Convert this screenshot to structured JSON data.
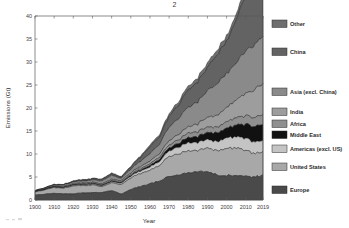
{
  "figure": {
    "title_fragment": "2",
    "background_color": "#ffffff"
  },
  "axes": {
    "x_title": "Year",
    "y_title": "Emissions (Gt)",
    "x_ticks": [
      "1900",
      "1910",
      "1920",
      "1930",
      "1940",
      "1950",
      "1960",
      "1970",
      "1980",
      "1990",
      "2000",
      "2010",
      "2019"
    ],
    "y_ticks": [
      "0",
      "5",
      "10",
      "15",
      "20",
      "25",
      "30",
      "35",
      "40"
    ],
    "x_min": 1900,
    "x_max": 2019,
    "y_min": 0,
    "y_max": 40
  },
  "legend": {
    "items": [
      {
        "label": "Other",
        "color": "#6e6e6e"
      },
      {
        "label": "China",
        "color": "#636363"
      },
      {
        "label": "Asia (excl. China)",
        "color": "#8a8a8a"
      },
      {
        "label": "India",
        "color": "#9d9d9d"
      },
      {
        "label": "Africa",
        "color": "#8f8f8f"
      },
      {
        "label": "Middle East",
        "color": "#111111"
      },
      {
        "label": "Americas (excl. US)",
        "color": "#c4c4c4"
      },
      {
        "label": "United States",
        "color": "#a8a8a8"
      },
      {
        "label": "Europe",
        "color": "#4a4a4a"
      }
    ]
  },
  "chart_data": {
    "type": "area",
    "xlabel": "Year",
    "ylabel": "Emissions (Gt)",
    "xlim": [
      1900,
      2019
    ],
    "ylim": [
      0,
      40
    ],
    "grid": false,
    "legend_position": "right",
    "stacked": true,
    "stack_order_bottom_to_top": [
      "Europe",
      "United States",
      "Americas (excl. US)",
      "Middle East",
      "Africa",
      "India",
      "Asia (excl. China)",
      "China",
      "Other"
    ],
    "x": [
      1900,
      1905,
      1910,
      1915,
      1920,
      1925,
      1930,
      1935,
      1940,
      1945,
      1950,
      1955,
      1960,
      1965,
      1970,
      1975,
      1980,
      1985,
      1990,
      1995,
      2000,
      2005,
      2010,
      2015,
      2019
    ],
    "series": [
      {
        "name": "Europe",
        "color": "#4a4a4a",
        "values": [
          1.05,
          1.25,
          1.45,
          1.35,
          1.35,
          1.55,
          1.6,
          1.65,
          2.05,
          1.25,
          2.3,
          2.95,
          3.55,
          4.2,
          5.05,
          5.35,
          5.95,
          6.05,
          6.1,
          5.45,
          5.35,
          5.35,
          5.1,
          5.0,
          5.4
        ]
      },
      {
        "name": "United States",
        "color": "#a8a8a8",
        "values": [
          0.65,
          0.95,
          1.25,
          1.25,
          1.7,
          1.6,
          1.65,
          1.3,
          1.7,
          2.05,
          2.5,
          2.8,
          2.95,
          3.45,
          4.35,
          4.55,
          4.8,
          4.55,
          5.1,
          5.35,
          5.9,
          6.0,
          5.6,
          5.2,
          5.1
        ]
      },
      {
        "name": "Americas (excl. US)",
        "color": "#c4c4c4",
        "values": [
          0.05,
          0.08,
          0.12,
          0.12,
          0.18,
          0.2,
          0.2,
          0.2,
          0.25,
          0.3,
          0.4,
          0.55,
          0.7,
          0.9,
          1.2,
          1.5,
          1.8,
          1.75,
          1.85,
          2.0,
          2.3,
          2.45,
          2.6,
          2.5,
          2.45
        ]
      },
      {
        "name": "Middle East",
        "color": "#111111",
        "values": [
          0.01,
          0.01,
          0.02,
          0.02,
          0.03,
          0.04,
          0.05,
          0.06,
          0.08,
          0.1,
          0.15,
          0.22,
          0.32,
          0.45,
          0.65,
          0.85,
          1.1,
          1.3,
          1.55,
          1.85,
          2.15,
          2.55,
          3.05,
          3.4,
          3.55
        ]
      },
      {
        "name": "Africa",
        "color": "#8f8f8f",
        "values": [
          0.02,
          0.03,
          0.05,
          0.06,
          0.08,
          0.1,
          0.11,
          0.12,
          0.15,
          0.17,
          0.22,
          0.3,
          0.38,
          0.48,
          0.62,
          0.78,
          0.95,
          1.05,
          1.15,
          1.25,
          1.4,
          1.6,
          1.85,
          2.0,
          2.1
        ]
      },
      {
        "name": "India",
        "color": "#9d9d9d",
        "values": [
          0.08,
          0.1,
          0.13,
          0.15,
          0.18,
          0.2,
          0.22,
          0.24,
          0.28,
          0.3,
          0.35,
          0.45,
          0.6,
          0.75,
          0.95,
          1.15,
          1.4,
          1.7,
          2.1,
          2.55,
          3.1,
          3.85,
          4.9,
          6.1,
          6.8
        ]
      },
      {
        "name": "Asia (excl. China)",
        "color": "#8a8a8a",
        "values": [
          0.1,
          0.15,
          0.22,
          0.3,
          0.38,
          0.45,
          0.52,
          0.65,
          0.85,
          0.5,
          0.8,
          1.15,
          1.6,
          2.1,
          2.95,
          3.5,
          4.2,
          4.8,
          5.7,
          6.8,
          7.4,
          8.2,
          9.2,
          9.8,
          10.1
        ]
      },
      {
        "name": "China",
        "color": "#636363",
        "values": [
          0.05,
          0.07,
          0.1,
          0.12,
          0.16,
          0.2,
          0.22,
          0.28,
          0.35,
          0.25,
          0.45,
          0.85,
          1.5,
          1.6,
          2.3,
          3.0,
          3.7,
          4.4,
          5.1,
          6.3,
          6.8,
          9.5,
          12.2,
          13.6,
          14.4
        ]
      },
      {
        "name": "Other",
        "color": "#6e6e6e",
        "values": [
          0.04,
          0.05,
          0.07,
          0.08,
          0.1,
          0.12,
          0.13,
          0.15,
          0.18,
          0.15,
          0.22,
          0.3,
          0.4,
          0.5,
          0.65,
          0.75,
          0.85,
          0.9,
          1.0,
          1.05,
          1.15,
          1.25,
          1.35,
          1.4,
          1.45
        ]
      }
    ],
    "total_2019": 38.9,
    "total_1900": 2.05
  }
}
